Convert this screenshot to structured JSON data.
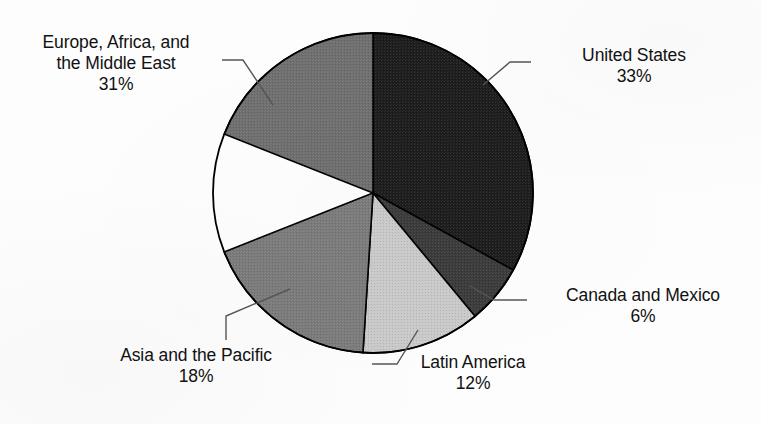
{
  "figure": {
    "background_color": "#fdfdfd",
    "text_color": "#111111",
    "leader_line_color": "#555555",
    "slice_border_color": "#000000"
  },
  "chart_data": {
    "type": "pie",
    "title": "",
    "xlabel": "",
    "ylabel": "",
    "legend_position": "none",
    "grid": false,
    "start_angle_deg": 0,
    "direction": "clockwise",
    "center": {
      "x": 373,
      "y": 193
    },
    "radius": 160,
    "units": "percent",
    "total": 100,
    "categories": [
      "United States",
      "Canada and Mexico",
      "Latin America",
      "Asia and the Pacific",
      "Europe, Africa, and the Middle East"
    ],
    "values": [
      33,
      6,
      12,
      18,
      31
    ],
    "colors": [
      "#1d1d1d",
      "#3b3b3b",
      "#cacaca",
      "#7c7c7c",
      "#6f6f6f"
    ],
    "slices": [
      {
        "label": "United States",
        "label_line1": "United States",
        "value": 33,
        "value_text": "33%",
        "color": "#1d1d1d",
        "start_deg": 0,
        "end_deg": 118.8
      },
      {
        "label": "Canada and Mexico",
        "label_line1": "Canada and Mexico",
        "value": 6,
        "value_text": "6%",
        "color": "#3b3b3b",
        "start_deg": 118.8,
        "end_deg": 140.4
      },
      {
        "label": "Latin America",
        "label_line1": "Latin America",
        "value": 12,
        "value_text": "12%",
        "color": "#cacaca",
        "start_deg": 140.4,
        "end_deg": 183.6
      },
      {
        "label": "Asia and the Pacific",
        "label_line1": "Asia and the Pacific",
        "value": 18,
        "value_text": "18%",
        "color": "#7c7c7c",
        "start_deg": 183.6,
        "end_deg": 248.4
      },
      {
        "label": "Europe, Africa, and the Middle East",
        "label_line1": "Europe, Africa, and",
        "label_line2": "the Middle East",
        "value": 31,
        "value_text": "31%",
        "color": "#6f6f6f",
        "start_deg": 248.4,
        "end_deg": 360
      }
    ]
  },
  "labels": {
    "emea": {
      "line1": "Europe, Africa, and",
      "line2": "the Middle East",
      "pct": "31%"
    },
    "united_states": {
      "line1": "United States",
      "pct": "33%"
    },
    "canada_mexico": {
      "line1": "Canada and Mexico",
      "pct": "6%"
    },
    "latin_america": {
      "line1": "Latin America",
      "pct": "12%"
    },
    "asia_pacific": {
      "line1": "Asia and the Pacific",
      "pct": "18%"
    }
  }
}
